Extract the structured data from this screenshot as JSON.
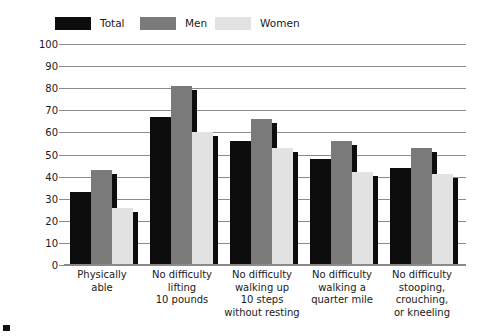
{
  "chart_data": {
    "type": "bar",
    "title": "",
    "xlabel": "",
    "ylabel": "Percentage",
    "ylim": [
      0,
      100
    ],
    "ytick_step": 10,
    "yticks": [
      100,
      90,
      80,
      70,
      60,
      50,
      40,
      30,
      20,
      10,
      0
    ],
    "grid": true,
    "legend_position": "top-left",
    "categories": [
      "Physically\nable",
      "No difficulty\nlifting\n10 pounds",
      "No difficulty\nwalking up\n10 steps\nwithout resting",
      "No difficulty\nwalking a\nquarter mile",
      "No difficulty\nstooping,\ncrouching,\nor kneeling"
    ],
    "category_lines": [
      [
        "Physically",
        "able"
      ],
      [
        "No difficulty",
        "lifting",
        "10 pounds"
      ],
      [
        "No difficulty",
        "walking up",
        "10 steps",
        "without resting"
      ],
      [
        "No difficulty",
        "walking a",
        "quarter mile"
      ],
      [
        "No difficulty",
        "stooping,",
        "crouching,",
        "or kneeling"
      ]
    ],
    "series": [
      {
        "name": "Total",
        "color": "#0d0d0d",
        "values": [
          33,
          67,
          56,
          48,
          44
        ]
      },
      {
        "name": "Men",
        "color": "#7a7a7a",
        "values": [
          43,
          81,
          66,
          56,
          53
        ]
      },
      {
        "name": "Women",
        "color": "#e2e2e2",
        "values": [
          26,
          60,
          53,
          42,
          41
        ]
      }
    ]
  },
  "legend": {
    "items": [
      {
        "label": "Total",
        "color": "#0d0d0d"
      },
      {
        "label": "Men",
        "color": "#7a7a7a"
      },
      {
        "label": "Women",
        "color": "#e2e2e2"
      }
    ]
  },
  "axis": {
    "y_title": "Percentage"
  },
  "colors": {
    "gridline": "#8a8a8a",
    "background": "#ffffff",
    "text": "#1a1a1a",
    "shadow": "#0d0d0d"
  }
}
